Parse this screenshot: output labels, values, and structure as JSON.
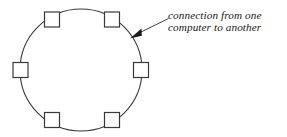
{
  "diagram": {
    "type": "ring-network-topology",
    "background_color": "#ffffff",
    "stroke_color": "#3a3a3a",
    "node_fill_color": "#ffffff",
    "text_color": "#1a1a1a",
    "ring": {
      "label": "network-ring",
      "center_x": 81,
      "center_y": 70,
      "radius": 61,
      "stroke_width": 1
    },
    "nodes": [
      {
        "id": "node-top-left",
        "label": "computer",
        "cx": 52,
        "cy": 19.5,
        "size": 15
      },
      {
        "id": "node-top-right",
        "label": "computer",
        "cx": 112,
        "cy": 19.5,
        "size": 15
      },
      {
        "id": "node-middle-left",
        "label": "computer",
        "cx": 20.5,
        "cy": 70,
        "size": 15
      },
      {
        "id": "node-middle-right",
        "label": "computer",
        "cx": 141,
        "cy": 70,
        "size": 15
      },
      {
        "id": "node-bottom-left",
        "label": "computer",
        "cx": 52,
        "cy": 120,
        "size": 15
      },
      {
        "id": "node-bottom-right",
        "label": "computer",
        "cx": 112,
        "cy": 120,
        "size": 15
      }
    ],
    "annotation": {
      "lines": [
        "connection from one",
        "computer to another"
      ],
      "line1": "connection from one",
      "line2": "computer to another",
      "text_x": 168,
      "line1_y": 19,
      "line2_y": 31,
      "arrow": {
        "tail_x": 169,
        "tail_y": 19,
        "head_x": 131,
        "head_y": 38
      }
    }
  }
}
